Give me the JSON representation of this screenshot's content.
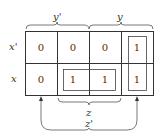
{
  "kmap": {
    "top_labels": {
      "y_prime": "y'",
      "y": "y"
    },
    "row_labels": [
      "x'",
      "x"
    ],
    "rows": [
      [
        "0",
        "0",
        "0",
        "1"
      ],
      [
        "0",
        "1",
        "1",
        "1"
      ]
    ],
    "bottom_labels": {
      "z": "z",
      "z_prime": "z'"
    }
  }
}
